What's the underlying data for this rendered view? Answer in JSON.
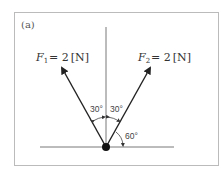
{
  "figure": {
    "tag": "(a)",
    "forces": [
      {
        "symbol": "F",
        "subscript": "1",
        "value": "= 2",
        "unit": "[N]",
        "direction": "up-left"
      },
      {
        "symbol": "F",
        "subscript": "2",
        "value": "= 2",
        "unit": "[N]",
        "direction": "up-right"
      }
    ],
    "angles": {
      "left_from_vertical": "30°",
      "right_from_vertical": "30°",
      "right_from_horizontal": "60°"
    },
    "colors": {
      "line": "#333333",
      "frame": "#bbbbbb",
      "dot": "#111111"
    }
  }
}
